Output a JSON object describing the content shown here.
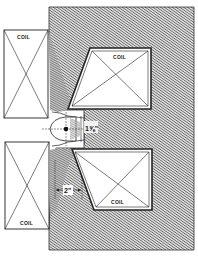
{
  "diagram": {
    "type": "magnet cross-section",
    "colors": {
      "background": "#ffffff",
      "iron_hatch_dark": "#3a3a3a",
      "iron_hatch_light": "#d8d8d8",
      "line": "#222222"
    },
    "coils": [
      {
        "id": "left-top",
        "label": "COIL",
        "x": 4,
        "y": 30,
        "w": 44,
        "h": 88
      },
      {
        "id": "left-bottom",
        "label": "COIL",
        "x": 5,
        "y": 142,
        "w": 44,
        "h": 87
      },
      {
        "id": "right-top",
        "label": "COIL"
      },
      {
        "id": "right-bottom",
        "label": "COIL"
      }
    ],
    "dimensions": {
      "gap_height": "1⅝\"",
      "pole_width": "2\""
    }
  }
}
